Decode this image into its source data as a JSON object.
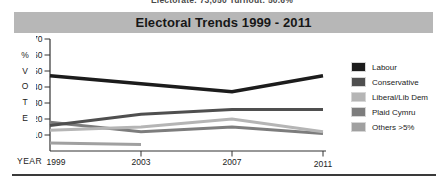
{
  "header": {
    "clipped_text": "Electorate: 73,050    Turnout: 50.6%"
  },
  "title": "Electoral Trends 1999 - 2011",
  "axis": {
    "y_letters": [
      "%",
      "V",
      "O",
      "T",
      "E"
    ],
    "x_label": "YEAR"
  },
  "colors": {
    "title_bar_bg": "#b7b7b7",
    "axis_line": "#333333",
    "tick_text": "#222222",
    "bottom_rule": "#3a3a3a"
  },
  "chart_data": {
    "type": "line",
    "title": "Electoral Trends 1999 - 2011",
    "x": [
      1999,
      2003,
      2007,
      2011
    ],
    "xlabel": "YEAR",
    "ylabel": "%VOTE",
    "ylim": [
      0,
      70
    ],
    "yticks": [
      70,
      60,
      50,
      40,
      30,
      20,
      10
    ],
    "grid": false,
    "legend_position": "right",
    "series": [
      {
        "name": "Labour",
        "color": "#1c1c1c",
        "width": 3.5,
        "values": [
          47,
          42,
          37,
          47
        ]
      },
      {
        "name": "Conservative",
        "color": "#4f4f4f",
        "width": 3,
        "values": [
          16,
          23,
          26,
          26
        ]
      },
      {
        "name": "Liberal/Lib Dem",
        "color": "#b5b5b5",
        "width": 3,
        "values": [
          13,
          15,
          20,
          12
        ]
      },
      {
        "name": "Plaid Cymru",
        "color": "#7d7d7d",
        "width": 3,
        "values": [
          18,
          12,
          15,
          11
        ]
      },
      {
        "name": "Others >5%",
        "color": "#a0a0a0",
        "width": 3,
        "values": [
          5,
          4,
          null,
          null
        ]
      }
    ]
  }
}
